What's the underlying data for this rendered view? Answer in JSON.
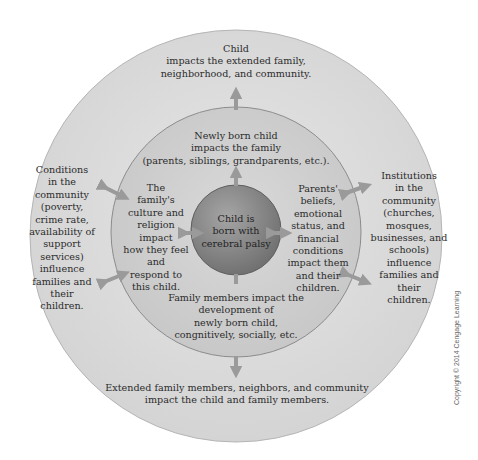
{
  "diagram": {
    "center": {
      "label": "Child is\nborn with\ncerebral palsy"
    },
    "family_ring": {
      "top": "Newly born child\nimpacts the family\n(parents, siblings, grandparents, etc.).",
      "left": "The\nfamily's\nculture and\nreligion\nimpact\nhow they feel\nand\nrespond to\nthis child.",
      "right": "Parents'\nbeliefs,\nemotional\nstatus, and\nfinancial\nconditions\nimpact them\nand their\nchildren.",
      "bottom": "Family members impact the\ndevelopment of\nnewly born child,\ncongnitively, socially, etc."
    },
    "community_ring": {
      "top": "Child\nimpacts the extended family,\nneighborhood, and community.",
      "left": "Conditions\nin the\ncommunity\n(poverty,\ncrime rate,\navailability of\nsupport\nservices)\ninfluence\nfamilies and\ntheir\nchildren.",
      "right": "Institutions\nin the\ncommunity\n(churches,\nmosques,\nbusinesses, and\nschools)\ninfluence\nfamilies and\ntheir\nchildren.",
      "bottom": "Extended family members, neighbors, and community\nimpact the child and family members."
    },
    "colors": {
      "outer_ring": "#dcdcdc",
      "middle_ring": "#cfcfcf",
      "center": "#8a8a8a",
      "arrow": "#9a9a9a",
      "stroke": "#8c8c8c"
    }
  },
  "copyright": "Copyright © 2014 Cengage Learning"
}
